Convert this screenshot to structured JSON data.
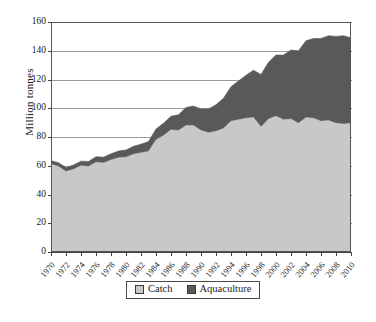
{
  "chart_data": {
    "type": "area",
    "stacked": true,
    "title": "",
    "xlabel": "",
    "ylabel": "Million tonnes",
    "ylim": [
      0,
      160
    ],
    "ytick_labels": [
      "0",
      "20",
      "40",
      "60",
      "80",
      "100",
      "120",
      "140",
      "160"
    ],
    "ytick_values": [
      0,
      20,
      40,
      60,
      80,
      100,
      120,
      140,
      160
    ],
    "grid": true,
    "legend_position": "bottom",
    "x": [
      1970,
      1971,
      1972,
      1973,
      1974,
      1975,
      1976,
      1977,
      1978,
      1979,
      1980,
      1981,
      1982,
      1983,
      1984,
      1985,
      1986,
      1987,
      1988,
      1989,
      1990,
      1991,
      1992,
      1993,
      1994,
      1995,
      1996,
      1997,
      1998,
      1999,
      2000,
      2001,
      2002,
      2003,
      2004,
      2005,
      2006,
      2007,
      2008,
      2009,
      2010
    ],
    "xtick_labels": [
      "1970",
      "1972",
      "1974",
      "1976",
      "1978",
      "1980",
      "1982",
      "1984",
      "1986",
      "1988",
      "1990",
      "1992",
      "1994",
      "1996",
      "1998",
      "2000",
      "2002",
      "2004",
      "2006",
      "2008",
      "2010"
    ],
    "series": [
      {
        "name": "Catch",
        "color": "#c8c8c8",
        "values": [
          61.0,
          59.5,
          56.0,
          57.5,
          60.0,
          59.5,
          62.5,
          62.0,
          64.0,
          65.5,
          66.0,
          68.0,
          69.0,
          70.0,
          78.0,
          81.0,
          85.0,
          84.5,
          88.0,
          88.0,
          84.5,
          83.0,
          84.0,
          86.0,
          91.0,
          92.0,
          93.0,
          93.5,
          87.0,
          92.5,
          94.5,
          92.0,
          92.5,
          89.5,
          93.5,
          93.0,
          91.0,
          91.5,
          89.5,
          89.0,
          89.5
        ]
      },
      {
        "name": "Aquaculture",
        "color": "#595959",
        "values": [
          2.5,
          2.6,
          2.8,
          3.0,
          3.2,
          3.5,
          3.8,
          4.0,
          4.3,
          4.7,
          5.0,
          5.5,
          6.0,
          6.8,
          7.5,
          8.5,
          9.5,
          11.0,
          12.5,
          13.5,
          15.0,
          16.5,
          18.5,
          21.0,
          24.0,
          27.0,
          30.0,
          33.0,
          36.5,
          39.5,
          42.5,
          45.0,
          48.0,
          50.5,
          53.5,
          55.5,
          57.5,
          59.0,
          60.5,
          61.5,
          59.5
        ]
      }
    ],
    "totals": [
      63.5,
      62.1,
      58.8,
      60.5,
      63.2,
      63.0,
      66.3,
      66.0,
      68.3,
      70.2,
      71.0,
      73.5,
      75.0,
      76.8,
      85.5,
      89.5,
      94.5,
      95.5,
      100.5,
      101.5,
      99.5,
      99.5,
      102.5,
      107.0,
      115.0,
      119.0,
      123.0,
      126.5,
      123.5,
      132.0,
      137.0,
      137.0,
      140.5,
      140.0,
      147.0,
      148.5,
      148.5,
      150.5,
      150.0,
      150.5,
      149.0
    ]
  },
  "legend": {
    "items": [
      {
        "label": "Catch",
        "color": "#c8c8c8"
      },
      {
        "label": "Aquaculture",
        "color": "#595959"
      }
    ]
  }
}
